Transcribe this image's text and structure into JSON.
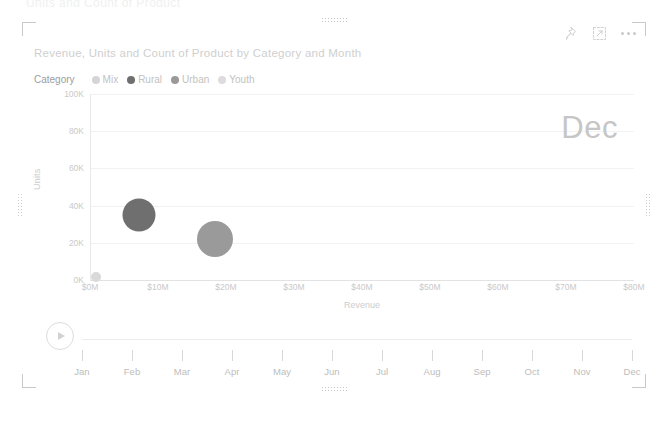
{
  "top_strip_text": "Units and Count of Product",
  "tile": {
    "title": "Revenue, Units and Count of Product by Category and Month",
    "actions": [
      {
        "name": "pin-icon",
        "label": "Pin visual"
      },
      {
        "name": "focus-mode-icon",
        "label": "Focus mode"
      },
      {
        "name": "more-options-icon",
        "label": "More options"
      }
    ]
  },
  "legend": {
    "title": "Category",
    "items": [
      {
        "label": "Mix",
        "color": "#d5d5d5"
      },
      {
        "label": "Rural",
        "color": "#6f6f6f"
      },
      {
        "label": "Urban",
        "color": "#9a9a9a"
      },
      {
        "label": "Youth",
        "color": "#dcdcdc"
      }
    ]
  },
  "current_month": "Dec",
  "chart_data": {
    "type": "scatter",
    "title": "Revenue, Units and Count of Product by Category and Month",
    "xlabel": "Revenue",
    "ylabel": "Units",
    "xlim": [
      0,
      80000000
    ],
    "ylim": [
      0,
      100000
    ],
    "grid": true,
    "legend_position": "top-left",
    "xtick_labels": [
      "$0M",
      "$10M",
      "$20M",
      "$30M",
      "$40M",
      "$50M",
      "$60M",
      "$70M",
      "$80M"
    ],
    "xtick_values": [
      0,
      10000000,
      20000000,
      30000000,
      40000000,
      50000000,
      60000000,
      70000000,
      80000000
    ],
    "ytick_labels": [
      "0K",
      "20K",
      "40K",
      "60K",
      "80K",
      "100K"
    ],
    "ytick_values": [
      0,
      20000,
      40000,
      60000,
      80000,
      100000
    ],
    "size_measure": "Count of Product",
    "points": [
      {
        "category": "Mix",
        "revenue": 800000,
        "units": 1500,
        "size": 10,
        "color": "#d9d9d9"
      },
      {
        "category": "Rural",
        "revenue": 7000000,
        "units": 35000,
        "size": 33,
        "color": "#6f6f6f"
      },
      {
        "category": "Urban",
        "revenue": 18200000,
        "units": 22000,
        "size": 36,
        "color": "#9a9a9a"
      }
    ]
  },
  "timeline": {
    "play_label": "Play",
    "months": [
      "Jan",
      "Feb",
      "Mar",
      "Apr",
      "May",
      "Jun",
      "Jul",
      "Aug",
      "Sep",
      "Oct",
      "Nov",
      "Dec"
    ]
  }
}
